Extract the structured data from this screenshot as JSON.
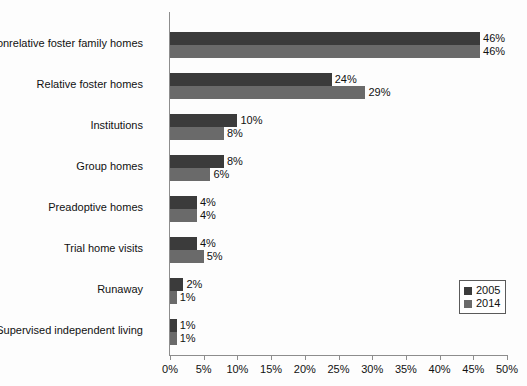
{
  "chart_data": {
    "type": "bar",
    "orientation": "horizontal",
    "title": "",
    "xlabel": "",
    "ylabel": "",
    "xlim": [
      0,
      50
    ],
    "xunit": "%",
    "grid": false,
    "legend_position": "bottom-right",
    "categories": [
      "Nonrelative foster family homes",
      "Relative foster homes",
      "Institutions",
      "Group homes",
      "Preadoptive homes",
      "Trial home visits",
      "Runaway",
      "Supervised independent living"
    ],
    "series": [
      {
        "name": "2005",
        "color": "#3b3b3b",
        "values": [
          46,
          24,
          10,
          8,
          4,
          4,
          2,
          1
        ]
      },
      {
        "name": "2014",
        "color": "#6a6a6a",
        "values": [
          46,
          29,
          8,
          6,
          4,
          5,
          1,
          1
        ]
      }
    ],
    "value_labels": {
      "2005": [
        "46%",
        "24%",
        "10%",
        "8%",
        "4%",
        "4%",
        "2%",
        "1%"
      ],
      "2014": [
        "46%",
        "29%",
        "8%",
        "6%",
        "4%",
        "5%",
        "1%",
        "1%"
      ]
    },
    "xticks": [
      0,
      5,
      10,
      15,
      20,
      25,
      30,
      35,
      40,
      45,
      50
    ],
    "xticklabels": [
      "0%",
      "5%",
      "10%",
      "15%",
      "20%",
      "25%",
      "30%",
      "35%",
      "40%",
      "45%",
      "50%"
    ]
  },
  "legend": {
    "items": [
      {
        "label": "2005",
        "color": "#3b3b3b"
      },
      {
        "label": "2014",
        "color": "#6a6a6a"
      }
    ]
  }
}
